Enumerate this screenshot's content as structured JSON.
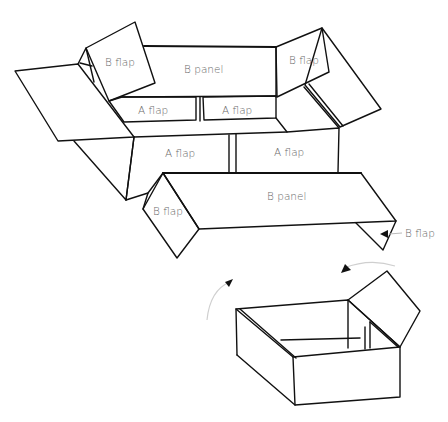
{
  "diagram": {
    "labels": {
      "b_flap_top_left": "B flap",
      "b_panel_top": "B panel",
      "b_flap_top_right": "B flap",
      "a_flap_inner_left": "A flap",
      "a_flap_inner_right": "A flap",
      "a_flap_outer_left": "A flap",
      "a_flap_outer_right": "A flap",
      "b_panel_front": "B panel",
      "b_flap_front_left": "B flap",
      "b_flap_callout": "B flap"
    },
    "parts": [
      "B panel",
      "B flap",
      "A flap"
    ],
    "figures": [
      {
        "name": "unfolded-box",
        "description": "Flattened box showing two B panels, four B flaps and four A flaps"
      },
      {
        "name": "assembled-box",
        "description": "Assembled open box with one flap raised and curved arrows indicating folding"
      }
    ],
    "colors": {
      "line": "#111111",
      "label": "#6a6a6a",
      "arrow_arc": "#cfcfcf"
    }
  }
}
